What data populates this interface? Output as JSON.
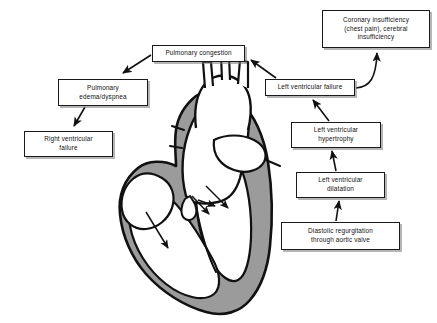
{
  "diagram": {
    "type": "medical-flowchart",
    "nodes": [
      {
        "id": "coronary",
        "label": "Coronary insufficiency\n(chest pain), cerebral\ninsufficiency"
      },
      {
        "id": "pulmcong",
        "label": "Pulmonary congestion"
      },
      {
        "id": "pulmedema",
        "label": "Pulmonary\nedema/dyspnea"
      },
      {
        "id": "rvfail",
        "label": "Right ventricular\nfailure"
      },
      {
        "id": "lvfail",
        "label": "Left ventricular failure"
      },
      {
        "id": "lvhyper",
        "label": "Left ventricular\nhypertrophy"
      },
      {
        "id": "lvdilat",
        "label": "Left ventricular\ndilatation"
      },
      {
        "id": "diastolic",
        "label": "Diastolic regurgitation\nthrough aortic valve"
      }
    ],
    "edges": [
      {
        "from": "diastolic",
        "to": "lvdilat"
      },
      {
        "from": "lvdilat",
        "to": "lvhyper"
      },
      {
        "from": "lvhyper",
        "to": "lvfail"
      },
      {
        "from": "lvfail",
        "to": "coronary"
      },
      {
        "from": "lvfail",
        "to": "pulmcong"
      },
      {
        "from": "pulmcong",
        "to": "pulmedema"
      },
      {
        "from": "pulmedema",
        "to": "rvfail"
      }
    ]
  },
  "illustration": {
    "name": "heart-cross-section",
    "flow_arrows": 4,
    "colors": {
      "outline": "#111111",
      "myocardium": "#9b9b9b",
      "chamber": "#ffffff",
      "background": "#ffffff",
      "box_shadow": "#8a8a8a"
    }
  }
}
